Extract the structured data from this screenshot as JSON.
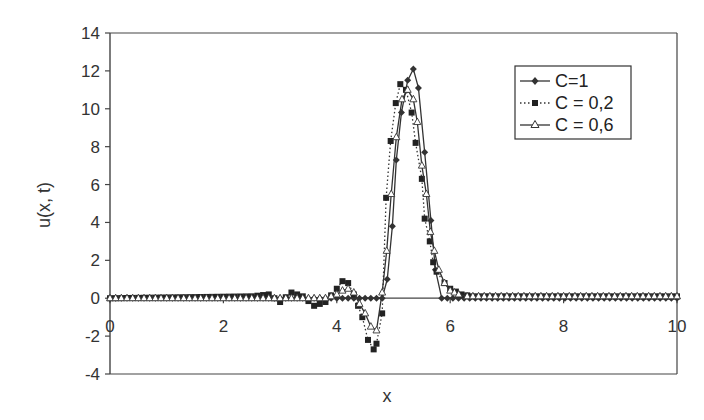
{
  "chart_data": {
    "type": "line",
    "title": "",
    "xlabel": "x",
    "ylabel": "u(x, t)",
    "xlim": [
      0,
      10
    ],
    "ylim": [
      -4,
      14
    ],
    "xticks": [
      0,
      2,
      4,
      6,
      8,
      10
    ],
    "yticks": [
      -4,
      -2,
      0,
      2,
      4,
      6,
      8,
      10,
      12,
      14
    ],
    "grid": false,
    "legend_position": "upper right",
    "series": [
      {
        "name": "C=1",
        "style": "solid",
        "marker": "diamond",
        "x": [
          0,
          4.8,
          4.89,
          4.98,
          5.05,
          5.14,
          5.25,
          5.35,
          5.44,
          5.55,
          5.66,
          5.74,
          5.85,
          10
        ],
        "y": [
          0,
          0,
          1.0,
          3.8,
          7.3,
          9.8,
          11.5,
          12.1,
          11.1,
          7.7,
          4.1,
          1.5,
          0,
          0
        ]
      },
      {
        "name": "C = 0,2",
        "style": "dotted",
        "marker": "square",
        "x": [
          0,
          2.5,
          2.8,
          3.0,
          3.2,
          3.4,
          3.6,
          3.8,
          4.0,
          4.1,
          4.2,
          4.3,
          4.45,
          4.55,
          4.65,
          4.7,
          4.8,
          4.87,
          4.95,
          5.04,
          5.12,
          5.22,
          5.32,
          5.39,
          5.5,
          5.55,
          5.64,
          5.7,
          5.76,
          5.9,
          6.0,
          6.2,
          6.4,
          10
        ],
        "y": [
          0,
          0.1,
          0.2,
          -0.2,
          0.3,
          0.1,
          -0.4,
          -0.2,
          0.5,
          0.9,
          0.8,
          0.2,
          -1.0,
          -2.2,
          -2.7,
          -2.4,
          -0.8,
          5.3,
          8.3,
          10.3,
          11.3,
          11.0,
          9.8,
          8.2,
          6.3,
          4.2,
          3.0,
          1.9,
          1.4,
          0.8,
          0.5,
          0.2,
          0.1,
          0.1
        ]
      },
      {
        "name": "C = 0,6",
        "style": "solid",
        "marker": "triangle",
        "x": [
          0,
          3.8,
          4.0,
          4.1,
          4.2,
          4.3,
          4.4,
          4.5,
          4.6,
          4.7,
          4.8,
          4.88,
          4.96,
          5.05,
          5.15,
          5.25,
          5.35,
          5.42,
          5.5,
          5.58,
          5.65,
          5.72,
          5.8,
          5.9,
          6.0,
          6.15,
          6.3,
          10
        ],
        "y": [
          0,
          0,
          0.2,
          0.4,
          0.5,
          0.3,
          -0.3,
          -0.8,
          -1.5,
          -1.7,
          0.3,
          2.5,
          5.5,
          8.5,
          10.5,
          11.0,
          10.5,
          9.3,
          7.0,
          5.5,
          3.5,
          2.5,
          1.5,
          0.8,
          0.4,
          0.2,
          0.1,
          0.1
        ]
      }
    ]
  },
  "legend": {
    "items": [
      {
        "label": "C=1"
      },
      {
        "label": "C = 0,2"
      },
      {
        "label": "C = 0,6"
      }
    ]
  },
  "axes": {
    "xlabel": "x",
    "ylabel": "u(x, t)"
  }
}
